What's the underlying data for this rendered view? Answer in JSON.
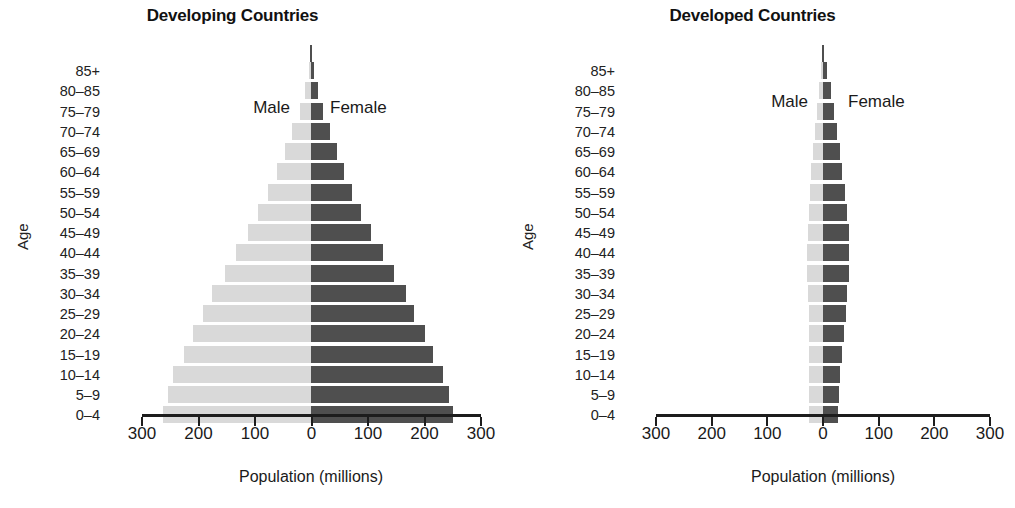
{
  "figure": {
    "axis_labels": {
      "y_title": "Age",
      "x_title": "Population (millions)"
    },
    "series_labels": {
      "male": "Male",
      "female": "Female"
    },
    "colors": {
      "male": "#d9d9d9",
      "female": "#4f4f4f",
      "axis": "#1d1d1d",
      "text": "#1a1a1a",
      "background": "#ffffff"
    },
    "x_tick_labels": [
      "300",
      "200",
      "100",
      "0",
      "100",
      "200",
      "300"
    ]
  },
  "chart_data": [
    {
      "type": "bar",
      "orientation": "population-pyramid",
      "title": "Developing Countries",
      "xlabel": "Population (millions)",
      "ylabel": "Age",
      "xlim": [
        -300,
        300
      ],
      "xticks": [
        -300,
        -200,
        -100,
        0,
        100,
        200,
        300
      ],
      "xtick_labels": [
        "300",
        "200",
        "100",
        "0",
        "100",
        "200",
        "300"
      ],
      "grid": false,
      "legend": "inline",
      "categories": [
        "85+",
        "80–85",
        "75–79",
        "70–74",
        "65–69",
        "60–64",
        "55–59",
        "50–54",
        "45–49",
        "40–44",
        "35–39",
        "30–34",
        "25–29",
        "20–24",
        "15–19",
        "10–14",
        "5–9",
        "0–4"
      ],
      "series": [
        {
          "name": "Male",
          "side": "left",
          "values": [
            4,
            10,
            20,
            33,
            46,
            60,
            75,
            92,
            110,
            130,
            150,
            172,
            188,
            205,
            222,
            240,
            250,
            258
          ]
        },
        {
          "name": "Female",
          "side": "right",
          "values": [
            6,
            12,
            21,
            33,
            45,
            58,
            72,
            88,
            105,
            125,
            144,
            165,
            180,
            198,
            212,
            230,
            240,
            247
          ]
        }
      ]
    },
    {
      "type": "bar",
      "orientation": "population-pyramid",
      "title": "Developed Countries",
      "xlabel": "Population (millions)",
      "ylabel": "Age",
      "xlim": [
        -300,
        300
      ],
      "xticks": [
        -300,
        -200,
        -100,
        0,
        100,
        200,
        300
      ],
      "xtick_labels": [
        "300",
        "200",
        "100",
        "0",
        "100",
        "200",
        "300"
      ],
      "grid": false,
      "legend": "inline",
      "categories": [
        "85+",
        "80–85",
        "75–79",
        "70–74",
        "65–69",
        "60–64",
        "55–59",
        "50–54",
        "45–49",
        "40–44",
        "35–39",
        "30–34",
        "25–29",
        "20–24",
        "15–19",
        "10–14",
        "5–9",
        "0–4"
      ],
      "series": [
        {
          "name": "Male",
          "side": "left",
          "values": [
            3,
            7,
            11,
            15,
            18,
            21,
            24,
            26,
            27,
            28,
            28,
            27,
            26,
            25,
            25,
            25,
            25,
            25
          ]
        },
        {
          "name": "Female",
          "side": "right",
          "values": [
            8,
            14,
            20,
            25,
            30,
            35,
            40,
            44,
            46,
            47,
            47,
            44,
            41,
            38,
            34,
            31,
            29,
            27
          ]
        }
      ]
    }
  ]
}
